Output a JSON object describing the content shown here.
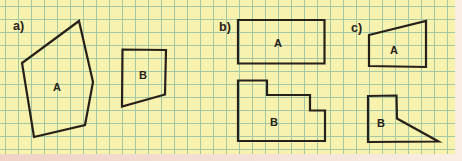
{
  "figure": {
    "grid_size_px": 13
  },
  "panel": {
    "background_color": "#f7f2ad",
    "grid_color": "#a4c8a4",
    "outline_color": "#26201a",
    "label_color": "#26201a",
    "edge_left_color": "#f0d2c6",
    "edge_right_color": "#f9ede4"
  },
  "sections": [
    {
      "id": "a",
      "label": "a)",
      "x": 13,
      "y": 20
    },
    {
      "id": "b",
      "label": "b)",
      "x": 219,
      "y": 21
    },
    {
      "id": "c",
      "label": "c)",
      "x": 351,
      "y": 22
    }
  ],
  "shapes": [
    {
      "id": "a-A",
      "section": "a",
      "label": "A",
      "label_x": 57,
      "label_y": 87,
      "points": "79,21 22,63 34,137 85,125 93,82"
    },
    {
      "id": "a-B",
      "section": "a",
      "label": "B",
      "label_x": 143,
      "label_y": 75,
      "points": "122.5,49.5 166,50 165,94.5 122,106.5"
    },
    {
      "id": "b-A",
      "section": "b",
      "label": "A",
      "label_x": 278,
      "label_y": 43,
      "points": "238,20 324.5,20 324.5,63.5 238,63.5"
    },
    {
      "id": "b-B",
      "section": "b",
      "label": "B",
      "label_x": 274,
      "label_y": 122,
      "points": "238,80.5 267,80.5 267,95 310,95 310,110.5 325,110.5 325,141 238,141"
    },
    {
      "id": "c-A",
      "section": "c",
      "label": "A",
      "label_x": 394,
      "label_y": 50,
      "points": "369,35 426,21 426,67 369,66"
    },
    {
      "id": "c-B",
      "section": "c",
      "label": "B",
      "label_x": 381,
      "label_y": 123,
      "points": "368,96 396.5,95.5 397,118.5 438.5,141.5 368,142"
    }
  ]
}
